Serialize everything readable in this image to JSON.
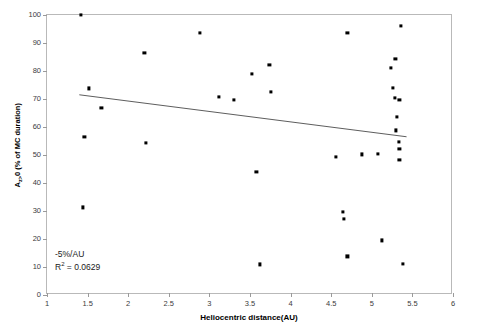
{
  "chart_data": {
    "type": "scatter",
    "title": "",
    "xlabel": "Heliocentric distance(AU)",
    "ylabel_prefix": "A",
    "ylabel_subscript": "z>",
    "ylabel_suffix": "0 (% of MC duration)",
    "ylabel_full": "Az>0 (% of MC duration)",
    "xlim": [
      1,
      6
    ],
    "ylim": [
      0,
      100
    ],
    "xticks": [
      1,
      1.5,
      2,
      2.5,
      3,
      3.5,
      4,
      4.5,
      5,
      5.5,
      6
    ],
    "xtick_labels": [
      "1",
      "1.5",
      "2",
      "2.5",
      "3",
      "3.5",
      "4",
      "4.5",
      "5",
      "5.5",
      "6"
    ],
    "yticks": [
      0,
      10,
      20,
      30,
      40,
      50,
      60,
      70,
      80,
      90,
      100
    ],
    "ytick_labels": [
      "0",
      "10",
      "20",
      "30",
      "40",
      "50",
      "60",
      "70",
      "80",
      "90",
      "100"
    ],
    "grid": false,
    "legend": "none",
    "marker": "square",
    "marker_color": "#000000",
    "points": [
      {
        "x": 1.42,
        "y": 100.0
      },
      {
        "x": 1.44,
        "y": 31.3
      },
      {
        "x": 1.46,
        "y": 56.4
      },
      {
        "x": 1.52,
        "y": 73.8
      },
      {
        "x": 1.67,
        "y": 66.8
      },
      {
        "x": 2.2,
        "y": 86.6
      },
      {
        "x": 2.22,
        "y": 54.2
      },
      {
        "x": 2.88,
        "y": 93.6
      },
      {
        "x": 3.12,
        "y": 70.8
      },
      {
        "x": 3.3,
        "y": 69.6
      },
      {
        "x": 3.52,
        "y": 79.0
      },
      {
        "x": 3.58,
        "y": 44.0
      },
      {
        "x": 3.62,
        "y": 10.9
      },
      {
        "x": 3.74,
        "y": 82.1
      },
      {
        "x": 3.76,
        "y": 72.6
      },
      {
        "x": 4.56,
        "y": 49.2
      },
      {
        "x": 4.64,
        "y": 29.8
      },
      {
        "x": 4.66,
        "y": 27.3
      },
      {
        "x": 4.7,
        "y": 13.8
      },
      {
        "x": 4.7,
        "y": 93.5
      },
      {
        "x": 4.88,
        "y": 50.2
      },
      {
        "x": 5.08,
        "y": 50.5
      },
      {
        "x": 5.12,
        "y": 19.5
      },
      {
        "x": 5.24,
        "y": 81.0
      },
      {
        "x": 5.26,
        "y": 74.0
      },
      {
        "x": 5.28,
        "y": 70.4
      },
      {
        "x": 5.29,
        "y": 84.3
      },
      {
        "x": 5.3,
        "y": 58.8
      },
      {
        "x": 5.31,
        "y": 63.6
      },
      {
        "x": 5.33,
        "y": 54.8
      },
      {
        "x": 5.34,
        "y": 69.6
      },
      {
        "x": 5.34,
        "y": 52.1
      },
      {
        "x": 5.34,
        "y": 48.3
      },
      {
        "x": 5.36,
        "y": 96.2
      },
      {
        "x": 5.38,
        "y": 11.0
      }
    ],
    "trendline": {
      "x_start": 1.4,
      "y_start": 71.3,
      "x_end": 5.45,
      "y_end": 56.2,
      "color": "#4a4a4a",
      "width": 0.9
    },
    "annotation": {
      "slope_text": "-5%/AU",
      "r2_label": "R",
      "r2_exponent": "2",
      "r2_value": " = 0.0629",
      "r2_full": "R2 = 0.0629"
    }
  }
}
